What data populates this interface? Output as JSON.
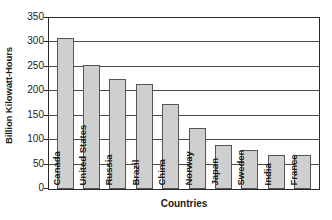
{
  "chart_data": {
    "type": "bar",
    "title": "",
    "xlabel": "Countries",
    "ylabel": "Billion Kilowatt-Hours",
    "categories": [
      "Canada",
      "United States",
      "Russia",
      "Brazil",
      "China",
      "Norway",
      "Japan",
      "Sweden",
      "India",
      "France"
    ],
    "values": [
      310,
      253,
      225,
      214,
      175,
      125,
      90,
      80,
      70,
      70
    ],
    "ylim": [
      0,
      350
    ],
    "yticks": [
      0,
      50,
      100,
      150,
      200,
      250,
      300,
      350
    ],
    "ytick_labels": [
      "0",
      "50",
      "100",
      "150",
      "200",
      "250",
      "300",
      "350"
    ],
    "grid": true,
    "legend": false,
    "bar_color": "#cfcfcf",
    "bar_border_color": "#555555",
    "axis_color": "#2a2a2a",
    "grid_color": "#4a4a4a",
    "text_color": "#1a1a1a"
  }
}
